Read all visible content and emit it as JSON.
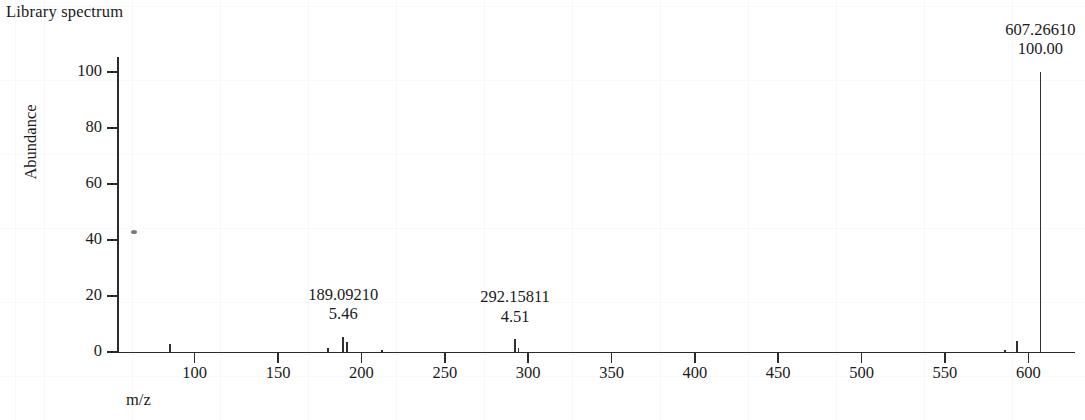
{
  "figure": {
    "title": "Library spectrum",
    "xlabel": "m/z",
    "ylabel": "Abundance"
  },
  "axes": {
    "y_ticks": [
      "0",
      "20",
      "40",
      "60",
      "80",
      "100"
    ],
    "x_ticks": [
      "100",
      "150",
      "200",
      "250",
      "300",
      "350",
      "400",
      "450",
      "500",
      "550",
      "600"
    ]
  },
  "annotations": [
    {
      "mz": "189.09210",
      "abundance": "5.46"
    },
    {
      "mz": "292.15811",
      "abundance": "4.51"
    },
    {
      "mz": "607.26610",
      "abundance": "100.00"
    }
  ],
  "colors": {
    "axis": "#2b2b2b",
    "peak": "#303034",
    "text": "#1a1a1a",
    "background": "#ffffff"
  },
  "chart_data": {
    "type": "bar",
    "title": "Library spectrum",
    "xlabel": "m/z",
    "ylabel": "Abundance",
    "xlim": [
      54,
      628
    ],
    "ylim": [
      0,
      105
    ],
    "grid": false,
    "legend": null,
    "x": [
      85.0,
      180.0,
      189.0921,
      191.1,
      212.1,
      292.15811,
      294.16,
      586.2,
      593.25,
      607.2661
    ],
    "values": [
      3.0,
      1.6,
      5.46,
      3.6,
      0.8,
      4.51,
      1.5,
      0.8,
      4.0,
      100.0
    ],
    "labeled_points": [
      {
        "x": 189.0921,
        "y": 5.46,
        "mz_label": "189.09210",
        "abundance_label": "5.46"
      },
      {
        "x": 292.15811,
        "y": 4.51,
        "mz_label": "292.15811",
        "abundance_label": "4.51"
      },
      {
        "x": 607.2661,
        "y": 100.0,
        "mz_label": "607.26610",
        "abundance_label": "100.00"
      }
    ],
    "base_peak": {
      "mz": 607.2661,
      "abundance": 100.0
    }
  }
}
